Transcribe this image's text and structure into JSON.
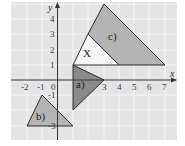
{
  "diagram": {
    "type": "coordinate-grid-triangles",
    "colors": {
      "background": "#e4e4e4",
      "grid": "#f4f4f4",
      "axis": "#333333",
      "shape_a": "#8a8a8a",
      "shape_b": "#b4b4b4",
      "shape_c": "#b4b4b4",
      "shape_x": "#f6f6f6",
      "outline": "#2a2a2a"
    },
    "axes": {
      "x_label": "x",
      "y_label": "y",
      "origin_label": "0",
      "x_ticks": [
        "-2",
        "-1",
        "3",
        "4",
        "5",
        "6",
        "7"
      ],
      "y_ticks": [
        "1",
        "2",
        "3",
        "4",
        "-1",
        "-3"
      ]
    },
    "shapes": [
      {
        "label": "a)",
        "vertices": [
          [
            1,
            1
          ],
          [
            3,
            0
          ],
          [
            1,
            -2
          ]
        ]
      },
      {
        "label": "b)",
        "vertices": [
          [
            -1,
            -1
          ],
          [
            -2,
            -3
          ],
          [
            1,
            -3
          ]
        ]
      },
      {
        "label": "c)",
        "vertices": [
          [
            2,
            3
          ],
          [
            3,
            5
          ],
          [
            7,
            1
          ],
          [
            4,
            1
          ]
        ]
      },
      {
        "label": "X",
        "vertices": [
          [
            1,
            1
          ],
          [
            2,
            3
          ],
          [
            4,
            1
          ]
        ]
      }
    ]
  }
}
